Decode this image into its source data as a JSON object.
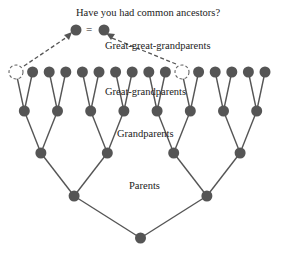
{
  "title": "Have you had common ancestors?",
  "equals_sign": "=",
  "labels": {
    "great_great_grandparents": "Great-great-grandparents",
    "great_grandparents": "Great-grandparents",
    "grandparents": "Grandparents",
    "parents": "Parents"
  },
  "colors": {
    "node": "#555555",
    "edge": "#555555",
    "text": "#222222",
    "background": "#ffffff"
  },
  "tree": {
    "generations": 5,
    "top_row_count": 16,
    "duplicated_ancestor_positions": [
      0,
      10
    ]
  }
}
